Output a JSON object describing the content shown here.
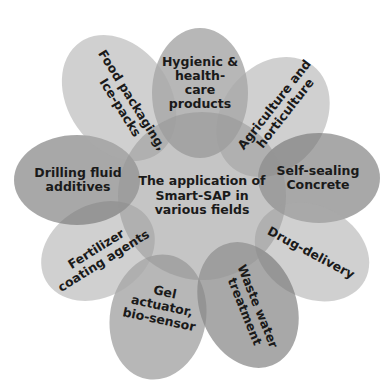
{
  "diagram": {
    "type": "radial-petal",
    "center": {
      "label": "The application of\nSmart-SAP in\nvarious fields"
    },
    "petals": [
      {
        "id": "hygienic",
        "label": "Hygienic &\nhealth-\ncare\nproducts"
      },
      {
        "id": "agriculture",
        "label": "Agriculture and\nhorticulture"
      },
      {
        "id": "self-sealing",
        "label": "Self-sealing\nConcrete"
      },
      {
        "id": "drug-delivery",
        "label": "Drug-delivery"
      },
      {
        "id": "waste-water",
        "label": "Waste water\ntreatment"
      },
      {
        "id": "gel-actuator",
        "label": "Gel\nactuator,\nbio-sensor"
      },
      {
        "id": "fertilizer",
        "label": "Fertilizer\ncoating agents"
      },
      {
        "id": "drilling-fluid",
        "label": "Drilling fluid\nadditives"
      },
      {
        "id": "food-packaging",
        "label": "Food packaging,\nIce-packs"
      }
    ],
    "colors": {
      "petal_fill": "#8c8c8c",
      "petal_light": "#bdbdbd",
      "center_fill": "#9a9a9a",
      "text": "#1a1a1a",
      "background": "#ffffff"
    }
  }
}
